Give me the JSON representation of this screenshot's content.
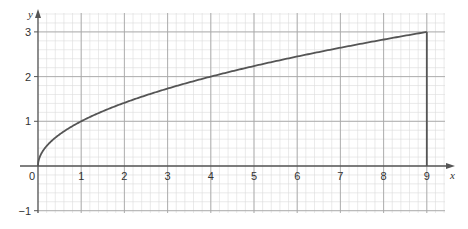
{
  "chart_data": {
    "type": "line",
    "title": "",
    "xlabel": "x",
    "ylabel": "y",
    "xlim": [
      0,
      9.4
    ],
    "ylim": [
      -1,
      3.4
    ],
    "x_ticks": [
      "0",
      "1",
      "2",
      "3",
      "4",
      "5",
      "6",
      "7",
      "8",
      "9"
    ],
    "y_ticks": [
      "-1",
      "1",
      "2",
      "3"
    ],
    "grid": true,
    "minor_grid_step": 0.2,
    "series": [
      {
        "name": "y = √x",
        "x": [
          0,
          0.04,
          0.25,
          0.5,
          1,
          1.5,
          2,
          2.5,
          3,
          4,
          5,
          6,
          7,
          8,
          9
        ],
        "y": [
          0,
          0.2,
          0.5,
          0.71,
          1,
          1.22,
          1.41,
          1.58,
          1.73,
          2,
          2.24,
          2.45,
          2.65,
          2.83,
          3
        ]
      }
    ],
    "annotations": [
      {
        "type": "vertical-line",
        "x": 9,
        "y_from": 0,
        "y_to": 3
      }
    ]
  },
  "colors": {
    "curve": "#555555",
    "axis": "#555555",
    "major_grid": "#a8a8a8",
    "minor_grid": "#dcdcdc"
  }
}
